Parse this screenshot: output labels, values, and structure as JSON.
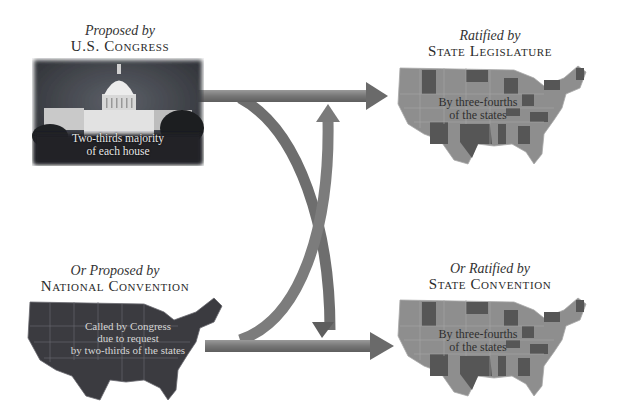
{
  "diagram": {
    "nodes": [
      {
        "id": "congress",
        "sub_label": "Proposed by",
        "main_label": "U.S. Congress",
        "caption_line1": "Two-thirds majority",
        "caption_line2": "of each house",
        "image": "capitol-building-photo"
      },
      {
        "id": "state-legislature",
        "sub_label": "Ratified by",
        "main_label": "State Legislature",
        "caption_line1": "By three-fourths",
        "caption_line2": "of the states",
        "image": "us-map-highlighted-states"
      },
      {
        "id": "national-convention",
        "sub_label": "Or Proposed by",
        "main_label": "National Convention",
        "caption_line1": "Called by Congress",
        "caption_line2": "due to request",
        "caption_line3": "by two-thirds of the states",
        "image": "us-map-dark"
      },
      {
        "id": "state-convention",
        "sub_label": "Or Ratified by",
        "main_label": "State Convention",
        "caption_line1": "By three-fourths",
        "caption_line2": "of the states",
        "image": "us-map-highlighted-states"
      }
    ],
    "edges": [
      {
        "from": "congress",
        "to": "state-legislature",
        "shape": "straight-arrow"
      },
      {
        "from": "congress",
        "to": "state-convention",
        "shape": "curved-arrow"
      },
      {
        "from": "national-convention",
        "to": "state-convention",
        "shape": "straight-arrow"
      },
      {
        "from": "national-convention",
        "to": "state-legislature",
        "shape": "curved-arrow"
      },
      {
        "from": "state-legislature",
        "to": "state-convention",
        "shape": "double-headed-vertical-arrow"
      }
    ],
    "colors": {
      "arrow": "#7a7a7a",
      "arrow_dark": "#5a5a5a",
      "map_light": "#8c8c8c",
      "map_dark_states": "#555555",
      "map_national": "#3a3a3e",
      "photo_bg": "#3c3f45",
      "text": "#2a2a2a"
    }
  }
}
